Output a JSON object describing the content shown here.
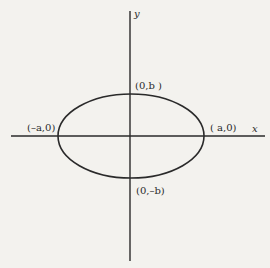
{
  "diagram": {
    "type": "ellipse",
    "colors": {
      "background": "#f3f2ee",
      "stroke": "#2a2a2a",
      "text": "#2a2a2a"
    },
    "axes": {
      "x_label": "x",
      "y_label": "y"
    },
    "points": {
      "top": "(0,b )",
      "bottom": "(0,–b)",
      "left": "(–a,0)",
      "right": "( a,0)"
    }
  }
}
